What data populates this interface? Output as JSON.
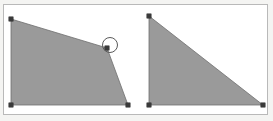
{
  "figure": {
    "background_color": "#f4f4f2",
    "canvas_color": "#ffffff",
    "frame_border_color": "#b9b9b9",
    "shape_fill_color": "#9a9a9a",
    "shape_stroke_color": "#6e6e6e",
    "vertex_marker_color": "#3a3a3a",
    "highlight_stroke_color": "#5a5a5a",
    "width": 273,
    "height": 121
  },
  "frame": {
    "x": 3,
    "y": 4,
    "width": 265,
    "height": 111
  },
  "shapes": [
    {
      "name": "left-quadrilateral",
      "type": "polygon",
      "points": "11,19 107,48 128,105 11,105",
      "fill": "#9a9a9a",
      "vertices": [
        {
          "x": 11,
          "y": 19
        },
        {
          "x": 107,
          "y": 48
        },
        {
          "x": 128,
          "y": 105
        },
        {
          "x": 11,
          "y": 105
        }
      ]
    },
    {
      "name": "right-triangle",
      "type": "polygon",
      "points": "149,16 149,105 263,105",
      "fill": "#9a9a9a",
      "vertices": [
        {
          "x": 149,
          "y": 16
        },
        {
          "x": 149,
          "y": 105
        },
        {
          "x": 263,
          "y": 105
        }
      ]
    }
  ],
  "annotations": [
    {
      "name": "vertex-highlight-circle",
      "type": "circle",
      "cx": 110,
      "cy": 45,
      "r": 7.5,
      "stroke": "#5a5a5a"
    }
  ],
  "chart_data": {
    "type": "scatter",
    "xlabel": "",
    "ylabel": "",
    "series": [
      {
        "name": "left-quadrilateral",
        "x": [
          11,
          107,
          128,
          11
        ],
        "y": [
          19,
          48,
          105,
          105
        ]
      },
      {
        "name": "right-triangle",
        "x": [
          149,
          149,
          263
        ],
        "y": [
          16,
          105,
          105
        ]
      }
    ],
    "annotations": [
      "circle highlight at (110, 45) radius 7.5"
    ],
    "xlim": [
      0,
      273
    ],
    "ylim": [
      0,
      121
    ],
    "grid": false,
    "legend": "none"
  }
}
